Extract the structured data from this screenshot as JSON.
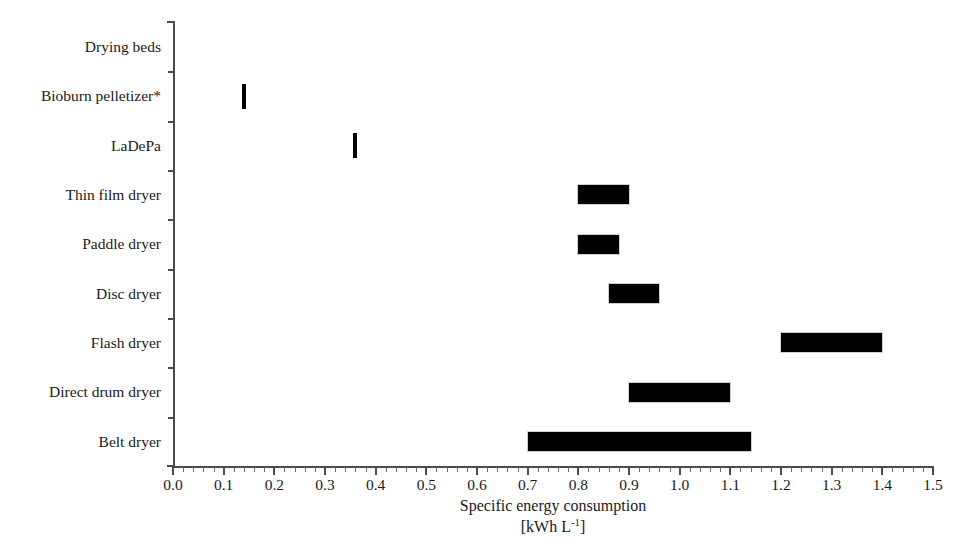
{
  "chart_data": {
    "type": "bar",
    "orientation": "horizontal",
    "title": "",
    "xlabel": "Specific energy consumption",
    "xunit": "[kWh L-1]",
    "xunit_base": "[kWh L",
    "xunit_exp": "-1",
    "xunit_close": "]",
    "ylabel": "",
    "xlim": [
      0.0,
      1.5
    ],
    "xticks": [
      0.0,
      0.1,
      0.2,
      0.3,
      0.4,
      0.5,
      0.6,
      0.7,
      0.8,
      0.9,
      1.0,
      1.1,
      1.2,
      1.3,
      1.4,
      1.5
    ],
    "xticklabels": [
      "0.0",
      "0.1",
      "0.2",
      "0.3",
      "0.4",
      "0.5",
      "0.6",
      "0.7",
      "0.8",
      "0.9",
      "1.0",
      "1.1",
      "1.2",
      "1.3",
      "1.4",
      "1.5"
    ],
    "minor_ticks_per_interval": 5,
    "grid": false,
    "legend": null,
    "categories": [
      "Drying beds",
      "Bioburn pelletizer*",
      "LaDePa",
      "Thin film dryer",
      "Paddle dryer",
      "Disc dryer",
      "Flash dryer",
      "Direct drum dryer",
      "Belt dryer"
    ],
    "ranges": [
      {
        "category": "Drying beds",
        "low": null,
        "high": null,
        "value": null,
        "has_data": false
      },
      {
        "category": "Bioburn pelletizer*",
        "low": 0.14,
        "high": 0.14,
        "value": 0.14,
        "has_data": true
      },
      {
        "category": "LaDePa",
        "low": 0.36,
        "high": 0.36,
        "value": 0.36,
        "has_data": true
      },
      {
        "category": "Thin film dryer",
        "low": 0.8,
        "high": 0.9,
        "value": null,
        "has_data": true
      },
      {
        "category": "Paddle dryer",
        "low": 0.8,
        "high": 0.88,
        "value": null,
        "has_data": true
      },
      {
        "category": "Disc dryer",
        "low": 0.86,
        "high": 0.96,
        "value": null,
        "has_data": true
      },
      {
        "category": "Flash dryer",
        "low": 1.2,
        "high": 1.4,
        "value": null,
        "has_data": true
      },
      {
        "category": "Direct drum dryer",
        "low": 0.9,
        "high": 1.1,
        "value": null,
        "has_data": true
      },
      {
        "category": "Belt dryer",
        "low": 0.7,
        "high": 1.14,
        "value": null,
        "has_data": true
      }
    ],
    "bar_color": "#000000",
    "axis_color": "#4a4a4a",
    "background_color": "#ffffff"
  }
}
